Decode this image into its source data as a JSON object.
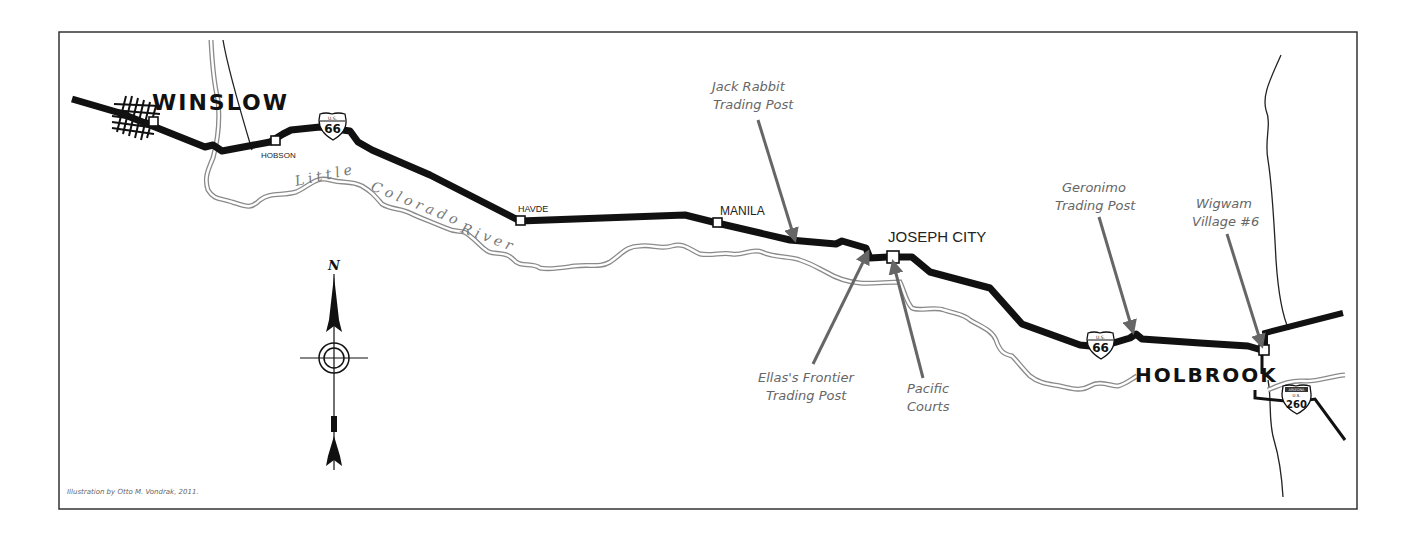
{
  "map": {
    "title": "Route 66: Winslow to Holbrook",
    "towns": [
      {
        "id": "winslow",
        "label": "WINSLOW"
      },
      {
        "id": "hobson",
        "label": "HOBSON"
      },
      {
        "id": "havde",
        "label": "HAVDE"
      },
      {
        "id": "manila",
        "label": "MANILA"
      },
      {
        "id": "joseph_city",
        "label": "JOSEPH CITY"
      },
      {
        "id": "holbrook",
        "label": "HOLBROOK"
      }
    ],
    "points_of_interest": [
      {
        "id": "jack_rabbit",
        "line1": "Jack Rabbit",
        "line2": "Trading Post"
      },
      {
        "id": "ellas",
        "line1": "Ellas's Frontier",
        "line2": "Trading Post"
      },
      {
        "id": "pacific",
        "line1": "Pacific",
        "line2": "Courts"
      },
      {
        "id": "geronimo",
        "line1": "Geronimo",
        "line2": "Trading Post"
      },
      {
        "id": "wigwam",
        "line1": "Wigwam",
        "line2": "Village #6"
      }
    ],
    "river": {
      "words": [
        "Little",
        "Colorado",
        "River"
      ]
    },
    "shields": [
      {
        "id": "us66_west",
        "top": "U.S.",
        "number": "66"
      },
      {
        "id": "us66_east",
        "top": "U.S.",
        "number": "66"
      },
      {
        "id": "us260",
        "state": "ARIZONA",
        "top": "U.S.",
        "number": "260"
      }
    ],
    "compass": {
      "north_label": "N"
    },
    "credit": "Illustration by Otto M. Vondrak, 2011.",
    "colors": {
      "road": "#111111",
      "river_outline": "#8a8a8a",
      "arrow": "#666666",
      "frame": "#333333"
    }
  }
}
